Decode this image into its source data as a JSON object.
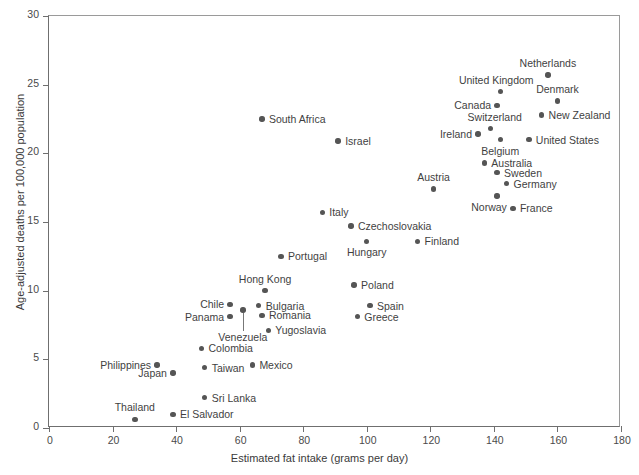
{
  "chart_data": {
    "type": "scatter",
    "title": "",
    "xlabel": "Estimated fat intake (grams per day)",
    "ylabel": "Age-adjusted deaths per 100,000 population",
    "xlim": [
      0,
      180
    ],
    "ylim": [
      0,
      30
    ],
    "xticks": [
      0,
      20,
      40,
      60,
      80,
      100,
      120,
      140,
      160,
      180
    ],
    "yticks": [
      0,
      5,
      10,
      15,
      20,
      25,
      30
    ],
    "grid": false,
    "legend": null,
    "point_color": "#555555",
    "axis_color": "#6f6f6f",
    "points": [
      {
        "label": "South Africa",
        "x": 67,
        "y": 22.5,
        "lpos": "right",
        "dx": 7,
        "dy": 0
      },
      {
        "label": "Israel",
        "x": 91,
        "y": 20.9,
        "lpos": "right",
        "dx": 7,
        "dy": 0
      },
      {
        "label": "Netherlands",
        "x": 157,
        "y": 25.7,
        "lpos": "above",
        "dx": 0,
        "dy": -7
      },
      {
        "label": "United Kingdom",
        "x": 142,
        "y": 24.5,
        "lpos": "above",
        "dx": -4,
        "dy": -7
      },
      {
        "label": "Denmark",
        "x": 160,
        "y": 23.8,
        "lpos": "above",
        "dx": 0,
        "dy": -7
      },
      {
        "label": "Canada",
        "x": 141,
        "y": 23.5,
        "lpos": "left",
        "dx": -6,
        "dy": 0
      },
      {
        "label": "New Zealand",
        "x": 155,
        "y": 22.8,
        "lpos": "right",
        "dx": 7,
        "dy": 0
      },
      {
        "label": "Switzerland",
        "x": 139,
        "y": 21.8,
        "lpos": "above",
        "dx": 4,
        "dy": -7
      },
      {
        "label": "Ireland",
        "x": 135,
        "y": 21.4,
        "lpos": "left",
        "dx": -6,
        "dy": 0
      },
      {
        "label": "Belgium",
        "x": 142,
        "y": 21.0,
        "lpos": "below",
        "dx": 0,
        "dy": 6
      },
      {
        "label": "United States",
        "x": 151,
        "y": 21.0,
        "lpos": "right",
        "dx": 7,
        "dy": 0
      },
      {
        "label": "Australia",
        "x": 137,
        "y": 19.3,
        "lpos": "right",
        "dx": 7,
        "dy": 0
      },
      {
        "label": "Sweden",
        "x": 141,
        "y": 18.6,
        "lpos": "right",
        "dx": 7,
        "dy": 0
      },
      {
        "label": "Germany",
        "x": 144,
        "y": 17.8,
        "lpos": "right",
        "dx": 7,
        "dy": 0
      },
      {
        "label": "Austria",
        "x": 121,
        "y": 17.4,
        "lpos": "above",
        "dx": 0,
        "dy": -7
      },
      {
        "label": "Norway",
        "x": 141,
        "y": 16.9,
        "lpos": "below",
        "dx": -8,
        "dy": 6
      },
      {
        "label": "France",
        "x": 146,
        "y": 16.0,
        "lpos": "right",
        "dx": 7,
        "dy": 0
      },
      {
        "label": "Italy",
        "x": 86,
        "y": 15.7,
        "lpos": "right",
        "dx": 7,
        "dy": 0
      },
      {
        "label": "Czechoslovakia",
        "x": 95,
        "y": 14.7,
        "lpos": "right",
        "dx": 7,
        "dy": 0
      },
      {
        "label": "Hungary",
        "x": 100,
        "y": 13.6,
        "lpos": "below",
        "dx": 0,
        "dy": 6
      },
      {
        "label": "Finland",
        "x": 116,
        "y": 13.6,
        "lpos": "right",
        "dx": 7,
        "dy": 0
      },
      {
        "label": "Portugal",
        "x": 73,
        "y": 12.5,
        "lpos": "right",
        "dx": 7,
        "dy": 0
      },
      {
        "label": "Hong Kong",
        "x": 68,
        "y": 10.0,
        "lpos": "above",
        "dx": 0,
        "dy": -7
      },
      {
        "label": "Poland",
        "x": 96,
        "y": 10.4,
        "lpos": "right",
        "dx": 7,
        "dy": 0
      },
      {
        "label": "Bulgaria",
        "x": 66,
        "y": 8.9,
        "lpos": "right",
        "dx": 7,
        "dy": 0
      },
      {
        "label": "Chile",
        "x": 57,
        "y": 9.0,
        "lpos": "left",
        "dx": -6,
        "dy": 0
      },
      {
        "label": "Panama",
        "x": 57,
        "y": 8.1,
        "lpos": "left",
        "dx": -6,
        "dy": 0
      },
      {
        "label": "Romania",
        "x": 67,
        "y": 8.2,
        "lpos": "right",
        "dx": 7,
        "dy": 0
      },
      {
        "label": "Spain",
        "x": 101,
        "y": 8.9,
        "lpos": "right",
        "dx": 7,
        "dy": 0
      },
      {
        "label": "Greece",
        "x": 97,
        "y": 8.1,
        "lpos": "right",
        "dx": 7,
        "dy": 0
      },
      {
        "label": "Yugoslavia",
        "x": 69,
        "y": 7.1,
        "lpos": "right",
        "dx": 7,
        "dy": 0
      },
      {
        "label": "Venezuela",
        "x": 61,
        "y": 8.6,
        "lpos": "leader",
        "dx": 0,
        "dy": 22
      },
      {
        "label": "Colombia",
        "x": 48,
        "y": 5.8,
        "lpos": "right",
        "dx": 7,
        "dy": 0
      },
      {
        "label": "Mexico",
        "x": 64,
        "y": 4.6,
        "lpos": "right",
        "dx": 7,
        "dy": 0
      },
      {
        "label": "Taiwan",
        "x": 49,
        "y": 4.4,
        "lpos": "right",
        "dx": 7,
        "dy": 0
      },
      {
        "label": "Philippines",
        "x": 34,
        "y": 4.6,
        "lpos": "left",
        "dx": -6,
        "dy": 0
      },
      {
        "label": "Japan",
        "x": 39,
        "y": 4.0,
        "lpos": "left",
        "dx": -6,
        "dy": 0
      },
      {
        "label": "Sri Lanka",
        "x": 49,
        "y": 2.2,
        "lpos": "right",
        "dx": 7,
        "dy": 0
      },
      {
        "label": "El Salvador",
        "x": 39,
        "y": 1.0,
        "lpos": "right",
        "dx": 7,
        "dy": 0
      },
      {
        "label": "Thailand",
        "x": 27,
        "y": 0.6,
        "lpos": "above",
        "dx": 0,
        "dy": -8
      }
    ]
  }
}
